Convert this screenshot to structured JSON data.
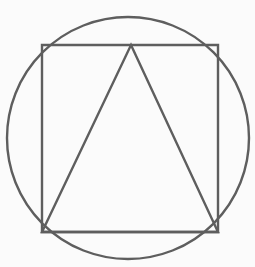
{
  "canvas": {
    "width": 255,
    "height": 267,
    "background_color": "#fbfbfb",
    "description": "Line drawing of a circle with an inscribed square and an inscribed triangle"
  },
  "style": {
    "stroke_color": "#5e5e5e",
    "stroke_width": 2.4,
    "fill": "none"
  },
  "shapes": [
    {
      "name": "circle",
      "type": "circle",
      "center_x": 128,
      "center_y": 138,
      "radius": 121,
      "stroke_color": "#5e5e5e",
      "stroke_width": 2.4
    },
    {
      "name": "square",
      "type": "rect",
      "x": 42,
      "y": 45,
      "width": 176,
      "height": 187,
      "corners": [
        [
          42,
          45
        ],
        [
          218,
          45
        ],
        [
          218,
          232
        ],
        [
          42,
          232
        ]
      ],
      "stroke_color": "#5e5e5e",
      "stroke_width": 2.4
    },
    {
      "name": "triangle",
      "type": "polygon",
      "points": [
        [
          131,
          45
        ],
        [
          218,
          232
        ],
        [
          42,
          232
        ]
      ],
      "apex": [
        131,
        45
      ],
      "base_left": [
        42,
        232
      ],
      "base_right": [
        218,
        232
      ],
      "stroke_color": "#5e5e5e",
      "stroke_width": 2.4
    }
  ]
}
